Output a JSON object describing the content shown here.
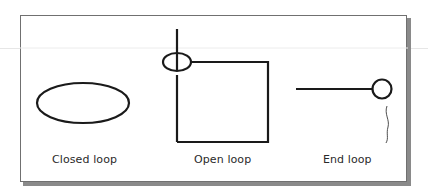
{
  "figure": {
    "panels": [
      {
        "id": "closed",
        "label": "Closed loop",
        "shape": "ellipse"
      },
      {
        "id": "open",
        "label": "Open loop",
        "shape": "rectangle-with-ring-at-corner"
      },
      {
        "id": "end",
        "label": "End loop",
        "shape": "line-ending-in-ring"
      }
    ]
  },
  "colors": {
    "stroke": "#1a1a1a",
    "frame": "#6a6a6a",
    "shadow": "#8a8a8a",
    "label": "#2a2a2a"
  }
}
